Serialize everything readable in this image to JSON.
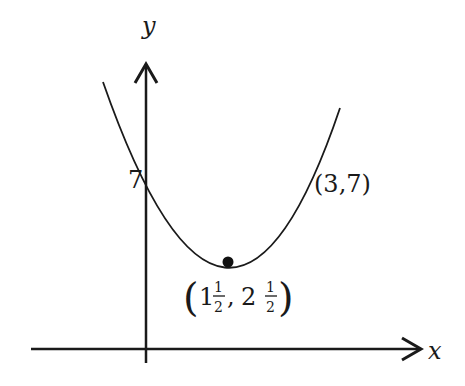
{
  "diagram": {
    "type": "parabola-sketch",
    "axes": {
      "x_label": "x",
      "y_label": "y"
    },
    "labels": {
      "y_intercept": "7",
      "point_right": "(3,7)",
      "vertex_open": "(",
      "vertex_x_whole": "1",
      "vertex_x_num": "1",
      "vertex_x_den": "2",
      "vertex_sep": ",",
      "vertex_y_whole": "2",
      "vertex_y_num": "1",
      "vertex_y_den": "2",
      "vertex_close": ")"
    },
    "points": [
      {
        "name": "y-intercept",
        "x": 0,
        "y": 7
      },
      {
        "name": "point",
        "x": 3,
        "y": 7
      },
      {
        "name": "vertex",
        "x": 1.5,
        "y": 2.5
      }
    ],
    "colors": {
      "stroke": "#1a1a1a",
      "background": "#ffffff"
    }
  }
}
